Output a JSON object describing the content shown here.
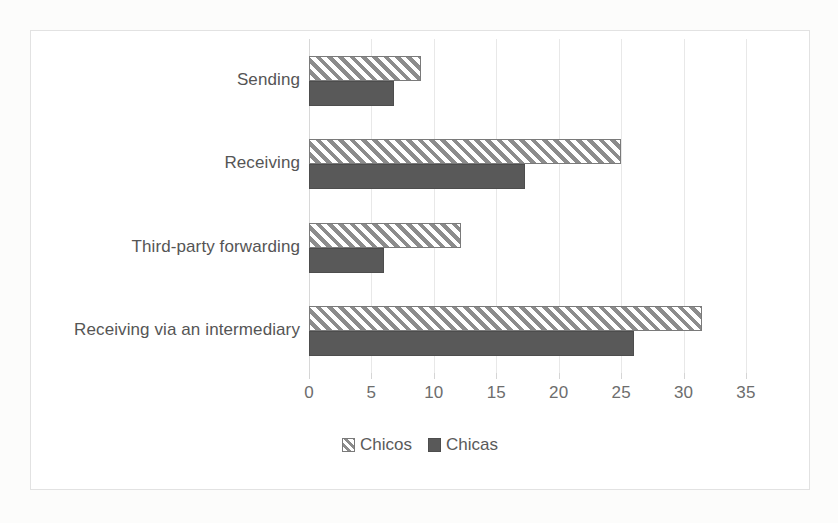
{
  "chart_data": {
    "type": "bar",
    "orientation": "horizontal",
    "title": "",
    "xlabel": "",
    "ylabel": "",
    "xlim": [
      0,
      35
    ],
    "xticks": [
      0,
      5,
      10,
      15,
      20,
      25,
      30,
      35
    ],
    "xtick_labels": [
      "0",
      "5",
      "10",
      "15",
      "20",
      "25",
      "30",
      "35"
    ],
    "grid": true,
    "grid_axis": "x",
    "legend_position": "bottom",
    "categories": [
      "Sending",
      "Receiving",
      "Third-party forwarding",
      "Receiving via an intermediary"
    ],
    "series": [
      {
        "name": "Chicos",
        "fill": "diagonal-hatch",
        "color": "#8c8c8c",
        "values": [
          9.0,
          25.0,
          12.2,
          31.5
        ]
      },
      {
        "name": "Chicas",
        "fill": "solid",
        "color": "#595959",
        "values": [
          6.8,
          17.3,
          6.0,
          26.0
        ]
      }
    ]
  },
  "legend": {
    "items": [
      {
        "label": "Chicos",
        "swatch": "hatched-square-icon"
      },
      {
        "label": "Chicas",
        "swatch": "filled-square-icon"
      }
    ]
  },
  "colors": {
    "chicos_stripe": "#8c8c8c",
    "chicas_fill": "#595959",
    "gridline": "#e8e8e8",
    "frame": "#e2e2e2",
    "text": "#5a5a5a"
  }
}
